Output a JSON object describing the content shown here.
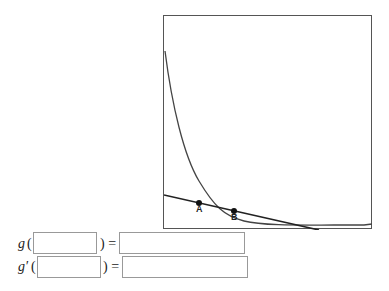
{
  "graph": {
    "points": [
      {
        "label": "A"
      },
      {
        "label": "B"
      }
    ]
  },
  "rows": [
    {
      "func": "g",
      "open": "(",
      "close": ") =",
      "arg_value": "",
      "result_value": ""
    },
    {
      "func": "g′",
      "open": "(",
      "close": ") =",
      "arg_value": "",
      "result_value": ""
    }
  ]
}
